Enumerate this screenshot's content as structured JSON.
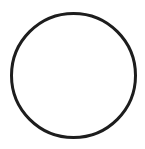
{
  "document": {
    "title": "Circle Outline",
    "kind": "line-drawing",
    "background_color": "#ffffff"
  },
  "canvas": {
    "width": 145,
    "height": 149,
    "background_color": "#ffffff"
  },
  "figure": {
    "name": "circle-outline",
    "shape": "circle",
    "stroke_color": "#1d1d1d",
    "fill_color": "none",
    "stroke_width_px": 3,
    "center_x": 73.5,
    "center_y": 75.5,
    "radius_x": 62,
    "radius_y": 62,
    "bounds": {
      "left": 11,
      "top": 13,
      "right": 136,
      "bottom": 138
    }
  },
  "labels": {
    "alt_text": "Empty circle outline"
  }
}
